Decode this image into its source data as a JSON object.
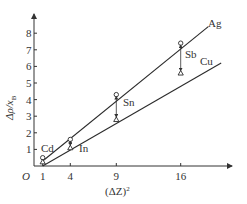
{
  "chart_data": {
    "type": "line",
    "title": "",
    "xlabel": "(ΔZ)²",
    "ylabel": "Δρ/x_B",
    "origin_label": "O",
    "xlim": [
      0,
      22
    ],
    "ylim": [
      0,
      9
    ],
    "x_ticks": [
      1,
      4,
      9,
      16
    ],
    "y_ticks": [
      1,
      2,
      3,
      4,
      5,
      6,
      7,
      8
    ],
    "grid": false,
    "legend": "inline labels at line ends",
    "series": [
      {
        "name": "Ag",
        "marker": "circle",
        "x": [
          1,
          4,
          9,
          16
        ],
        "values": [
          0.5,
          1.6,
          4.3,
          7.4
        ],
        "fit_line": {
          "x": [
            1,
            19
          ],
          "y": [
            0.3,
            8.4
          ]
        }
      },
      {
        "name": "Cu",
        "marker": "triangle",
        "x": [
          1,
          4,
          9,
          16
        ],
        "values": [
          0.25,
          1.1,
          2.8,
          5.6
        ],
        "fit_line": {
          "x": [
            1,
            20.4
          ],
          "y": [
            0.0,
            6.2
          ]
        }
      }
    ],
    "annotations": [
      {
        "text": "Cd",
        "x": 1,
        "note": "solute label near x=1"
      },
      {
        "text": "In",
        "x": 4,
        "note": "solute label near x=4"
      },
      {
        "text": "Sn",
        "x": 9,
        "note": "solute label near x=9, double arrow between series"
      },
      {
        "text": "Sb",
        "x": 16,
        "note": "solute label near x=16, double arrow between series"
      }
    ]
  },
  "labels": {
    "ag": "Ag",
    "cu": "Cu",
    "cd": "Cd",
    "in": "In",
    "sn": "Sn",
    "sb": "Sb",
    "origin": "O",
    "xlabel": "(ΔZ)",
    "xlabel_sup": "2",
    "ylabel_main": "Δρ/x",
    "ylabel_sub": "B"
  },
  "colors": {
    "line": "#2b2b2b",
    "axis": "#333333",
    "text": "#333333",
    "background": "#ffffff"
  }
}
